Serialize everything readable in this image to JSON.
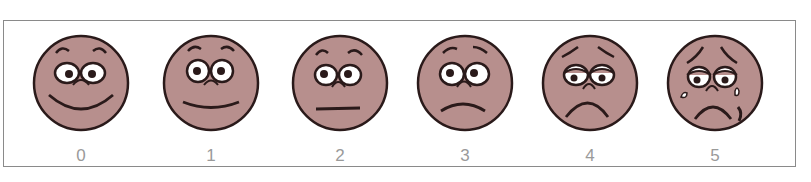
{
  "scale": {
    "title": "",
    "face_color": "#b78f8d",
    "line_color": "#2a1a1a",
    "faces": [
      {
        "rating": "0",
        "expression": "very happy"
      },
      {
        "rating": "1",
        "expression": "happy"
      },
      {
        "rating": "2",
        "expression": "neutral"
      },
      {
        "rating": "3",
        "expression": "slightly sad"
      },
      {
        "rating": "4",
        "expression": "sad"
      },
      {
        "rating": "5",
        "expression": "crying"
      }
    ]
  }
}
